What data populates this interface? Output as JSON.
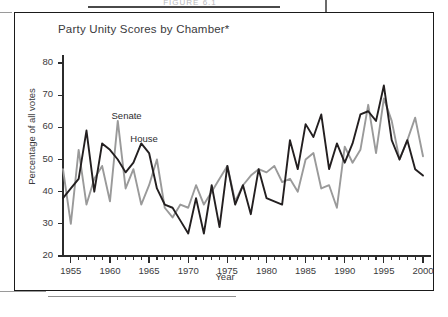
{
  "page": {
    "top_faint_text": "FIGURE 6.1",
    "figure_border_color": "#1a1a1a"
  },
  "figure": {
    "title": "Party Unity Scores by Chamber*",
    "series_labels": {
      "senate": "Senate",
      "house": "House"
    }
  },
  "chart_data": {
    "type": "line",
    "title": "Party Unity Scores by Chamber*",
    "xlabel": "Year",
    "ylabel": "Percentage of all votes",
    "xlim": [
      1954,
      2000
    ],
    "ylim": [
      20,
      80
    ],
    "ytick_values": [
      20,
      30,
      40,
      50,
      60,
      70,
      80
    ],
    "xtick_values": [
      1955,
      1960,
      1965,
      1970,
      1975,
      1980,
      1985,
      1990,
      1995,
      2000
    ],
    "minor_xticks": "annual",
    "grid": false,
    "legend": "inline-annotations",
    "colors": {
      "house": "#231f20",
      "senate": "#9a9a9a"
    },
    "x": [
      1954,
      1955,
      1956,
      1957,
      1958,
      1959,
      1960,
      1961,
      1962,
      1963,
      1964,
      1965,
      1966,
      1967,
      1968,
      1969,
      1970,
      1971,
      1972,
      1973,
      1974,
      1975,
      1976,
      1977,
      1978,
      1979,
      1980,
      1981,
      1982,
      1983,
      1984,
      1985,
      1986,
      1987,
      1988,
      1989,
      1990,
      1991,
      1992,
      1993,
      1994,
      1995,
      1996,
      1997,
      1998,
      1999,
      2000
    ],
    "series": [
      {
        "name": "House",
        "values": [
          38,
          41,
          44,
          59,
          40,
          55,
          53,
          50,
          46,
          49,
          55,
          52,
          41,
          36,
          35,
          31,
          27,
          38,
          27,
          42,
          29,
          48,
          36,
          42,
          33,
          47,
          38,
          37,
          36,
          56,
          47,
          61,
          57,
          64,
          47,
          55,
          49,
          55,
          64,
          65,
          62,
          73,
          56,
          50,
          56,
          47,
          45
        ]
      },
      {
        "name": "Senate",
        "values": [
          47,
          30,
          53,
          36,
          44,
          48,
          37,
          62,
          41,
          47,
          36,
          42,
          50,
          35,
          32,
          36,
          35,
          42,
          36,
          40,
          44,
          48,
          37,
          42,
          45,
          47,
          46,
          48,
          43,
          44,
          40,
          50,
          52,
          41,
          42,
          35,
          54,
          49,
          53,
          67,
          52,
          69,
          62,
          50,
          56,
          63,
          51
        ]
      }
    ]
  }
}
